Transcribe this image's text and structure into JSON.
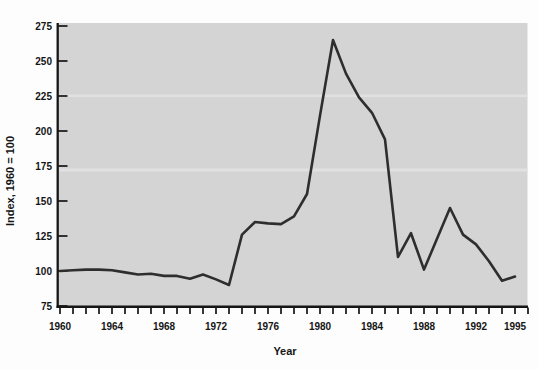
{
  "chart_data": {
    "type": "line",
    "title": "",
    "xlabel": "Year",
    "ylabel": "Index, 1960 = 100",
    "x": [
      1960,
      1961,
      1962,
      1963,
      1964,
      1965,
      1966,
      1967,
      1968,
      1969,
      1970,
      1971,
      1972,
      1973,
      1974,
      1975,
      1976,
      1977,
      1978,
      1979,
      1980,
      1981,
      1982,
      1983,
      1984,
      1985,
      1986,
      1987,
      1988,
      1989,
      1990,
      1991,
      1992,
      1993,
      1994,
      1995
    ],
    "values": [
      100,
      100.5,
      101,
      101,
      100.5,
      99,
      97.5,
      98,
      96.5,
      96.5,
      94.5,
      97.5,
      94,
      90,
      126,
      135,
      134,
      133.5,
      139,
      155,
      211,
      265,
      241,
      224,
      213,
      194,
      110,
      127,
      101,
      123,
      145,
      126,
      119,
      107,
      93,
      96
    ],
    "series_name": "Index, 1960 = 100",
    "xlim": [
      1960,
      1996
    ],
    "ylim": [
      75,
      275
    ],
    "yticks": [
      75,
      100,
      125,
      150,
      175,
      200,
      225,
      250,
      275
    ],
    "ytick_labels": [
      "75",
      "100",
      "125",
      "150",
      "175",
      "200",
      "225",
      "250",
      "275"
    ],
    "xtick_labeled_years": [
      1960,
      1964,
      1968,
      1972,
      1976,
      1980,
      1984,
      1988,
      1992,
      1995
    ],
    "xtick_labels": [
      "1960",
      "1964",
      "1968",
      "1972",
      "1976",
      "1980",
      "1984",
      "1988",
      "1992",
      "1995"
    ],
    "minor_xticks_every_year_from": 1960,
    "minor_xticks_every_year_to": 1996,
    "grid": false,
    "legend": "none",
    "peak_value": 265,
    "peak_year": 1981
  },
  "style": {
    "page_bg": "#fdfdfd",
    "plot_bg": "#d4d4d4",
    "plot_streak": "#e2e2e2",
    "line_color": "#2e2e2e",
    "axis_color": "#151515",
    "text_color": "#151515"
  }
}
